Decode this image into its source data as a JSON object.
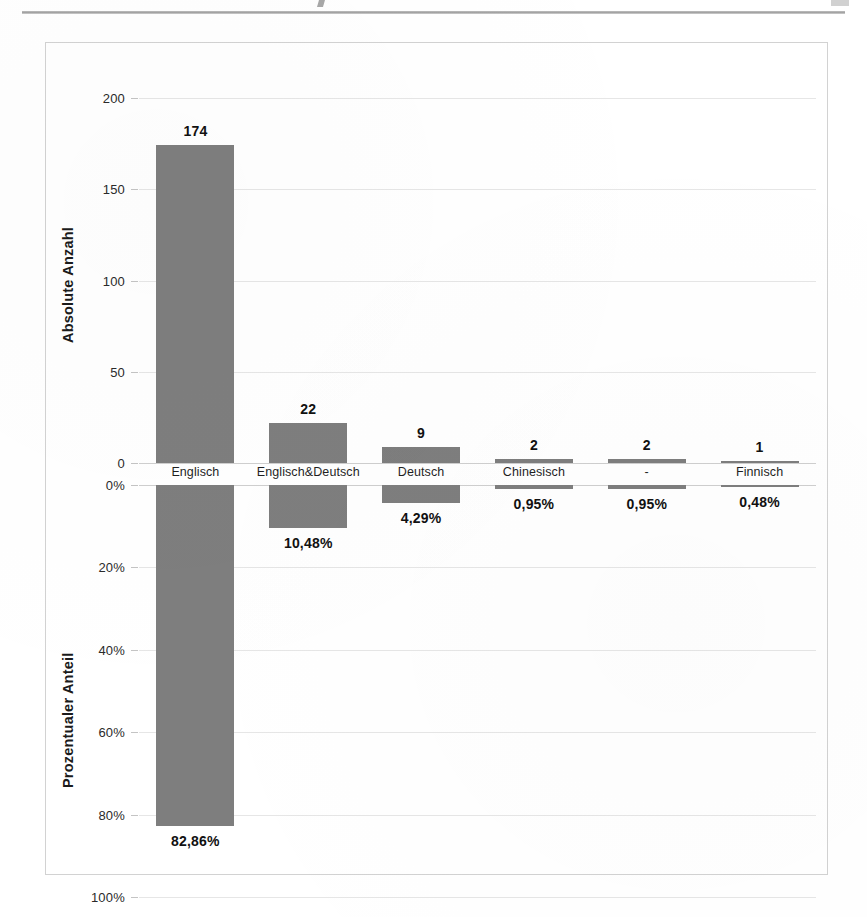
{
  "page": {
    "rule_visible": true
  },
  "chart_data": {
    "type": "bar",
    "title": "",
    "subtitle": "",
    "categories": [
      "Englisch",
      "Englisch&Deutsch",
      "Deutsch",
      "Chinesisch",
      "-",
      "Finnisch"
    ],
    "panels": [
      {
        "id": "absolute",
        "ylabel": "Absolute Anzahl",
        "ylim": [
          0,
          200
        ],
        "yticks": [
          0,
          50,
          100,
          150,
          200
        ],
        "ytick_labels": [
          "0",
          "50",
          "100",
          "150",
          "200"
        ],
        "direction": "up",
        "values": [
          174,
          22,
          9,
          2,
          2,
          1
        ],
        "data_labels": [
          "174",
          "22",
          "9",
          "2",
          "2",
          "1"
        ]
      },
      {
        "id": "percent",
        "ylabel": "Prozentualer Anteil",
        "ylim": [
          0,
          100
        ],
        "yticks": [
          0,
          20,
          40,
          60,
          80,
          100
        ],
        "ytick_labels": [
          "0%",
          "20%",
          "40%",
          "60%",
          "80%",
          "100%"
        ],
        "direction": "down",
        "values": [
          82.86,
          10.48,
          4.29,
          0.95,
          0.95,
          0.48
        ],
        "data_labels": [
          "82,86%",
          "10,48%",
          "4,29%",
          "0,95%",
          "0,95%",
          "0,48%"
        ]
      }
    ],
    "grid": true,
    "legend": null,
    "bar_color": "#7e7e7e",
    "gridline_color": "#e6e6e6",
    "text_color": "#1b1b1b"
  }
}
